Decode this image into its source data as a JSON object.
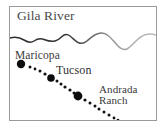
{
  "figure": {
    "kind": "line-drawing-map",
    "width": 165,
    "height": 128,
    "background_color": "#ffffff",
    "frame": {
      "name": "map-border",
      "color": "#9a9a9a",
      "x": 9,
      "y": 6,
      "width": 148,
      "height": 115
    }
  },
  "labels": {
    "river": "Gila River",
    "maricopa": "Maricopa",
    "tucson": "Tucson",
    "andrada_line1": "Andrada",
    "andrada_line2": "Ranch"
  },
  "features": {
    "river": {
      "name": "Gila River",
      "color_dark": "#2e2e2e",
      "color_light": "#b4b4b4",
      "path": "M 10 38 C 16 36.5 20 37.5 24 40 C 28 42.5 31 43 34 41 C 37 39 40 38 44 39.5 C 48 41 51 42 55 41 C 58 40.2 60 38.5 62 36.5 C 64.5 34 67 33.8 70 36 C 73 38.2 75 41 78 42.5 C 81 44 84 43.5 87 41 C 90 38.5 93 35.5 97 34 C 101 32.5 105 33 108 35.5 C 112 38.5 115 43 118 46 C 121 49 124 50.5 127 49 C 130 47.5 133 44 136 41 C 139 38 142 35.5 146 34.5 C 150 33.5 153.5 34 156 35"
    },
    "route": {
      "name": "dotted route",
      "color": "#111111",
      "start": [
        21,
        64
      ],
      "end": [
        117,
        120
      ]
    }
  },
  "cities": [
    {
      "name": "Maricopa",
      "x": 21,
      "y": 64,
      "radius": 4.2
    },
    {
      "name": "Tucson",
      "x": 51,
      "y": 78,
      "radius": 3.8
    },
    {
      "name": "Andrada Ranch",
      "x": 78,
      "y": 96,
      "radius": 4.4
    }
  ],
  "route_dots": [
    {
      "x": 30,
      "y": 67,
      "r": 1.5
    },
    {
      "x": 35,
      "y": 69,
      "r": 1.4
    },
    {
      "x": 40,
      "y": 71,
      "r": 1.5
    },
    {
      "x": 45,
      "y": 74,
      "r": 1.6
    },
    {
      "x": 57,
      "y": 81,
      "r": 1.5
    },
    {
      "x": 61,
      "y": 84,
      "r": 1.5
    },
    {
      "x": 65,
      "y": 87,
      "r": 1.6
    },
    {
      "x": 70,
      "y": 90,
      "r": 1.6
    },
    {
      "x": 74,
      "y": 93,
      "r": 1.5
    },
    {
      "x": 85,
      "y": 100,
      "r": 1.6
    },
    {
      "x": 90,
      "y": 103,
      "r": 1.5
    },
    {
      "x": 95,
      "y": 106,
      "r": 1.5
    },
    {
      "x": 99,
      "y": 109,
      "r": 1.5
    },
    {
      "x": 104,
      "y": 112,
      "r": 1.5
    },
    {
      "x": 109,
      "y": 115,
      "r": 1.5
    },
    {
      "x": 114,
      "y": 118,
      "r": 1.4
    },
    {
      "x": 118,
      "y": 120,
      "r": 1.3
    }
  ]
}
